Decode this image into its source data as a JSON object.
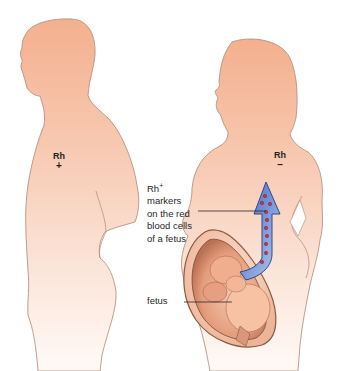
{
  "figure": {
    "colors": {
      "skin_top": "#f4b596",
      "skin_bottom": "#fdf3ee",
      "outline": "#b08876",
      "arrow_fill": "#5f7fc8",
      "arrow_edge": "#2d4a8a",
      "rbc_marker": "#c0344a",
      "uterus": "#c98a6c",
      "text": "#1f1f1f"
    }
  },
  "male_figure": {
    "rh_label": "Rh",
    "rh_sign": "+"
  },
  "female_figure": {
    "rh_label": "Rh",
    "rh_sign": "–"
  },
  "callouts": {
    "markers": {
      "base": "Rh",
      "superscript": "+",
      "lines": [
        "markers",
        "on the red",
        "blood cells",
        "of a fetus"
      ]
    },
    "fetus": "fetus"
  },
  "arrow": {
    "direction": "up",
    "meaning": "fetal Rh+ red blood cells entering maternal circulation",
    "marker_count": 10
  }
}
